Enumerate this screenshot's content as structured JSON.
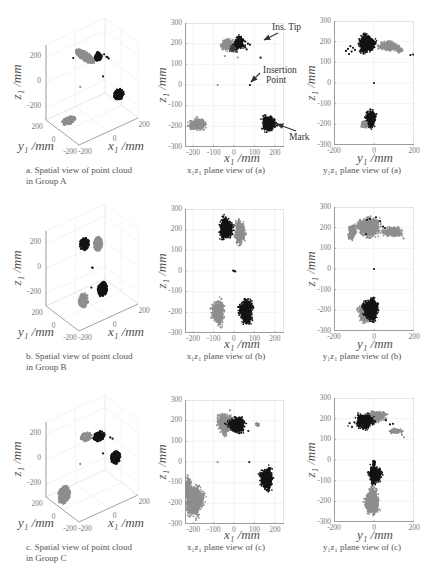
{
  "style_colors": {
    "black": "#141414",
    "gray": "#8e8e8e",
    "dark": "#3c3c3c",
    "axis": "#8a8a8a",
    "frame": "#d6d6d6",
    "grid": "#ebebeb",
    "annotation": "#333333"
  },
  "chart_data": [
    {
      "id": "a-spatial",
      "type": "scatter3d",
      "caption_lines": [
        "a. Spatial view of point cloud",
        "in Group A"
      ],
      "xlabel": "x₁ /mm",
      "ylabel": "y₁ /mm",
      "zlabel": "z₁ /mm",
      "xlim": [
        -200,
        200
      ],
      "ylim": [
        -200,
        200
      ],
      "zlim": [
        -300,
        300
      ],
      "xticks": [
        -200,
        0,
        200
      ],
      "yticks": [
        -200,
        0,
        200
      ],
      "zticks": [
        -200,
        0,
        200
      ],
      "grid": true,
      "clusters": [
        {
          "color": "gray",
          "c": [
            -180,
            -40,
            -195
          ],
          "r": [
            45,
            30,
            25
          ]
        },
        {
          "color": "black",
          "c": [
            170,
            -20,
            -185
          ],
          "r": [
            32,
            30,
            40
          ]
        },
        {
          "color": "gray",
          "c": [
            -25,
            40,
            195
          ],
          "r": [
            30,
            110,
            14
          ]
        },
        {
          "color": "black",
          "c": [
            20,
            -40,
            210
          ],
          "r": [
            22,
            28,
            32
          ]
        }
      ],
      "points": [
        [
          60,
          -40,
          205,
          "black"
        ],
        [
          70,
          -50,
          185,
          "black"
        ],
        [
          80,
          -60,
          170,
          "black"
        ],
        [
          90,
          -30,
          160,
          "black"
        ],
        [
          75,
          0,
          0,
          "black"
        ],
        [
          -80,
          0,
          0,
          "gray"
        ],
        [
          -60,
          120,
          160,
          "black"
        ]
      ]
    },
    {
      "id": "a-xz",
      "type": "scatter",
      "caption": "x₁z₁ plane view of (a)",
      "xlabel": "x₁ /mm",
      "ylabel": "z₁ /mm",
      "xlim": [
        -240,
        245
      ],
      "ylim": [
        -300,
        300
      ],
      "xticks": [
        -200,
        -100,
        0,
        100,
        200
      ],
      "yticks": [
        300,
        200,
        100,
        0,
        -100,
        -200,
        -300
      ],
      "grid": true,
      "clusters": [
        {
          "color": "gray",
          "c": [
            -180,
            -190
          ],
          "r": [
            45,
            30
          ]
        },
        {
          "color": "black",
          "c": [
            170,
            -185
          ],
          "r": [
            36,
            42
          ]
        },
        {
          "color": "gray",
          "c": [
            -32,
            195
          ],
          "r": [
            34,
            30
          ]
        },
        {
          "color": "dark",
          "c": [
            0,
            182
          ],
          "r": [
            22,
            24
          ]
        },
        {
          "color": "black",
          "c": [
            25,
            205
          ],
          "r": [
            26,
            34
          ]
        }
      ],
      "points": [
        [
          55,
          210,
          "black"
        ],
        [
          68,
          200,
          "black"
        ],
        [
          78,
          195,
          "black"
        ],
        [
          55,
          182,
          "black"
        ],
        [
          62,
          172,
          "black"
        ],
        [
          130,
          132,
          "black"
        ],
        [
          -45,
          140,
          "gray"
        ],
        [
          18,
          133,
          "gray"
        ],
        [
          -80,
          0,
          "gray"
        ],
        [
          78,
          0,
          "black"
        ]
      ],
      "annotations": [
        {
          "label": "Ins. Tip"
        },
        {
          "label_lines": [
            "Insertion",
            "Point"
          ]
        },
        {
          "label": "Mark"
        }
      ]
    },
    {
      "id": "a-yz",
      "type": "scatter",
      "caption": "y₁z₁ plane view of (a)",
      "xlabel": "y₁ /mm",
      "ylabel": "z₁ /mm",
      "xlim": [
        -200,
        200
      ],
      "ylim": [
        -300,
        300
      ],
      "xticks": [
        -200,
        0,
        200
      ],
      "yticks": [
        300,
        200,
        100,
        0,
        -100,
        -200,
        -300
      ],
      "grid": true,
      "clusters": [
        {
          "color": "gray",
          "c": [
            75,
            178
          ],
          "r": [
            55,
            24
          ]
        },
        {
          "color": "gray",
          "c": [
            128,
            158
          ],
          "r": [
            20,
            12
          ]
        },
        {
          "color": "black",
          "c": [
            -35,
            190
          ],
          "r": [
            45,
            45
          ]
        },
        {
          "color": "gray",
          "c": [
            -45,
            -200
          ],
          "r": [
            24,
            20
          ]
        },
        {
          "color": "black",
          "c": [
            -15,
            -172
          ],
          "r": [
            27,
            45
          ]
        }
      ],
      "points": [
        [
          -140,
          155,
          "black"
        ],
        [
          -130,
          165,
          "black"
        ],
        [
          -118,
          178,
          "black"
        ],
        [
          -105,
          170,
          "black"
        ],
        [
          -125,
          140,
          "black"
        ],
        [
          -112,
          152,
          "black"
        ],
        [
          -95,
          160,
          "black"
        ],
        [
          182,
          135,
          "black"
        ],
        [
          196,
          138,
          "black"
        ],
        [
          0,
          0,
          "black"
        ]
      ]
    },
    {
      "id": "b-spatial",
      "type": "scatter3d",
      "caption_lines": [
        "b. Spatial view of point cloud",
        "in Group B"
      ],
      "xlabel": "x₁ /mm",
      "ylabel": "y₁ /mm",
      "zlabel": "z₁ /mm",
      "xlim": [
        -200,
        200
      ],
      "ylim": [
        -200,
        200
      ],
      "zlim": [
        -300,
        300
      ],
      "xticks": [
        -200,
        0,
        200
      ],
      "yticks": [
        -200,
        0,
        200
      ],
      "zticks": [
        -200,
        0,
        200
      ],
      "grid": true,
      "clusters": [
        {
          "color": "gray",
          "c": [
            -80,
            -40,
            -200
          ],
          "r": [
            30,
            30,
            58
          ]
        },
        {
          "color": "black",
          "c": [
            60,
            -20,
            -195
          ],
          "r": [
            30,
            30,
            58
          ]
        },
        {
          "color": "gray",
          "c": [
            25,
            -30,
            190
          ],
          "r": [
            25,
            30,
            58
          ]
        },
        {
          "color": "black",
          "c": [
            -40,
            20,
            200
          ],
          "r": [
            30,
            30,
            48
          ]
        }
      ],
      "points": [
        [
          0,
          0,
          0,
          "black"
        ],
        [
          5,
          0,
          -5,
          "black"
        ],
        [
          -10,
          -10,
          -150,
          "black"
        ]
      ]
    },
    {
      "id": "b-xz",
      "type": "scatter",
      "caption": "x₁z₁ plane view of (b)",
      "xlabel": "x₁ /mm",
      "ylabel": "z₁ /mm",
      "xlim": [
        -240,
        245
      ],
      "ylim": [
        -300,
        300
      ],
      "xticks": [
        -200,
        -100,
        0,
        100,
        200
      ],
      "yticks": [
        300,
        200,
        100,
        0,
        -100,
        -200,
        -300
      ],
      "grid": true,
      "clusters": [
        {
          "color": "gray",
          "c": [
            28,
            188
          ],
          "r": [
            27,
            62
          ]
        },
        {
          "color": "black",
          "c": [
            -40,
            205
          ],
          "r": [
            35,
            55
          ]
        },
        {
          "color": "gray",
          "c": [
            -78,
            -200
          ],
          "r": [
            33,
            62
          ]
        },
        {
          "color": "black",
          "c": [
            60,
            -195
          ],
          "r": [
            33,
            65
          ]
        }
      ],
      "points": [
        [
          0,
          0,
          "black"
        ],
        [
          6,
          -2,
          "black"
        ],
        [
          -4,
          2,
          "black"
        ]
      ]
    },
    {
      "id": "b-yz",
      "type": "scatter",
      "caption": "y₁z₁ plane view of (b)",
      "xlabel": "y₁ /mm",
      "ylabel": "z₁ /mm",
      "xlim": [
        -200,
        200
      ],
      "ylim": [
        -300,
        300
      ],
      "xticks": [
        -200,
        0,
        200
      ],
      "yticks": [
        300,
        200,
        100,
        0,
        -100,
        -200,
        -300
      ],
      "grid": true,
      "clusters": [
        {
          "color": "gray",
          "c": [
            -110,
            178
          ],
          "r": [
            22,
            38
          ]
        },
        {
          "color": "gray",
          "c": [
            -25,
            205
          ],
          "r": [
            60,
            50
          ]
        },
        {
          "color": "gray",
          "c": [
            90,
            180
          ],
          "r": [
            55,
            25
          ]
        },
        {
          "color": "gray",
          "c": [
            -45,
            -215
          ],
          "r": [
            35,
            45
          ]
        },
        {
          "color": "black",
          "c": [
            -15,
            -195
          ],
          "r": [
            42,
            58
          ]
        }
      ],
      "points": [
        [
          -40,
          168,
          "black"
        ],
        [
          30,
          232,
          "black"
        ],
        [
          45,
          205,
          "black"
        ],
        [
          55,
          198,
          "black"
        ],
        [
          -20,
          243,
          "black"
        ],
        [
          -35,
          238,
          "black"
        ],
        [
          10,
          250,
          "black"
        ],
        [
          0,
          0,
          "black"
        ],
        [
          148,
          148,
          "gray"
        ]
      ]
    },
    {
      "id": "c-spatial",
      "type": "scatter3d",
      "caption_lines": [
        "c. Spatial view of point cloud",
        "in Group C"
      ],
      "xlabel": "x₁ /mm",
      "ylabel": "y₁ /mm",
      "zlabel": "z₁ /mm",
      "xlim": [
        -200,
        200
      ],
      "ylim": [
        -200,
        200
      ],
      "zlim": [
        -300,
        300
      ],
      "xticks": [
        -200,
        0,
        200
      ],
      "yticks": [
        -200,
        0,
        200
      ],
      "zticks": [
        -200,
        0,
        200
      ],
      "grid": true,
      "clusters": [
        {
          "color": "gray",
          "c": [
            -195,
            -10,
            -180
          ],
          "r": [
            40,
            30,
            70
          ]
        },
        {
          "color": "black",
          "c": [
            160,
            0,
            -80
          ],
          "r": [
            30,
            30,
            50
          ]
        },
        {
          "color": "gray",
          "c": [
            -40,
            0,
            195
          ],
          "r": [
            35,
            35,
            28
          ]
        },
        {
          "color": "black",
          "c": [
            25,
            -40,
            185
          ],
          "r": [
            35,
            30,
            35
          ]
        }
      ],
      "points": [
        [
          -80,
          0,
          0,
          "gray"
        ],
        [
          75,
          0,
          0,
          "black"
        ],
        [
          90,
          -60,
          150,
          "black"
        ],
        [
          100,
          -70,
          140,
          "black"
        ]
      ]
    },
    {
      "id": "c-xz",
      "type": "scatter",
      "caption": "x₁z₁ plane view of (c)",
      "xlabel": "x₁ /mm",
      "ylabel": "z₁ /mm",
      "xlim": [
        -240,
        245
      ],
      "ylim": [
        -300,
        300
      ],
      "xticks": [
        -200,
        -100,
        0,
        100,
        200
      ],
      "yticks": [
        300,
        200,
        100,
        0,
        -100,
        -200,
        -300
      ],
      "grid": true,
      "clusters": [
        {
          "color": "gray",
          "c": [
            -195,
            -185
          ],
          "r": [
            50,
            78
          ]
        },
        {
          "color": "gray",
          "c": [
            -225,
            -110
          ],
          "r": [
            16,
            40
          ]
        },
        {
          "color": "black",
          "c": [
            160,
            -80
          ],
          "r": [
            35,
            55
          ]
        },
        {
          "color": "gray",
          "c": [
            -40,
            185
          ],
          "r": [
            45,
            52
          ]
        },
        {
          "color": "black",
          "c": [
            15,
            180
          ],
          "r": [
            45,
            40
          ]
        },
        {
          "color": "gray",
          "c": [
            115,
            182
          ],
          "r": [
            9,
            8
          ]
        }
      ],
      "points": [
        [
          -80,
          0,
          "gray"
        ],
        [
          75,
          0,
          "black"
        ],
        [
          70,
          150,
          "black"
        ],
        [
          -20,
          250,
          "gray"
        ]
      ]
    },
    {
      "id": "c-yz",
      "type": "scatter",
      "caption": "y₁z₁ plane view of (c)",
      "xlabel": "y₁ /mm",
      "ylabel": "z₁ /mm",
      "xlim": [
        -200,
        200
      ],
      "ylim": [
        -300,
        300
      ],
      "xticks": [
        -200,
        0,
        200
      ],
      "yticks": [
        300,
        200,
        100,
        0,
        -100,
        -200,
        -300
      ],
      "grid": true,
      "clusters": [
        {
          "color": "gray",
          "c": [
            -10,
            -200
          ],
          "r": [
            38,
            68
          ]
        },
        {
          "color": "black",
          "c": [
            5,
            -70
          ],
          "r": [
            35,
            45
          ]
        },
        {
          "color": "black",
          "c": [
            0,
            -15
          ],
          "r": [
            6,
            15
          ]
        },
        {
          "color": "gray",
          "c": [
            10,
            212
          ],
          "r": [
            55,
            28
          ]
        },
        {
          "color": "gray",
          "c": [
            110,
            140
          ],
          "r": [
            35,
            14
          ]
        },
        {
          "color": "black",
          "c": [
            -45,
            188
          ],
          "r": [
            45,
            40
          ]
        }
      ],
      "points": [
        [
          -122,
          178,
          "black"
        ],
        [
          -110,
          160,
          "black"
        ],
        [
          -98,
          182,
          "black"
        ],
        [
          60,
          192,
          "black"
        ],
        [
          80,
          172,
          "black"
        ],
        [
          95,
          175,
          "black"
        ],
        [
          150,
          110,
          "gray"
        ],
        [
          140,
          122,
          "gray"
        ],
        [
          -130,
          165,
          "gray"
        ]
      ]
    }
  ]
}
